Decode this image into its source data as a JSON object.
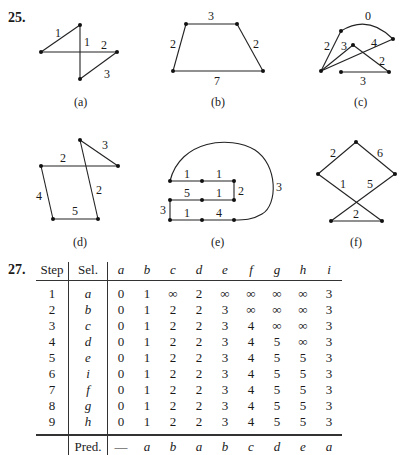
{
  "problem25": {
    "number": "25.",
    "graphs": [
      {
        "id": "a",
        "caption": "(a)",
        "edge_labels": [
          "1",
          "1",
          "2",
          "3"
        ]
      },
      {
        "id": "b",
        "caption": "(b)",
        "edge_labels": [
          "3",
          "2",
          "2",
          "7"
        ]
      },
      {
        "id": "c",
        "caption": "(c)",
        "edge_labels": [
          "0",
          "2",
          "3",
          "4",
          "2",
          "3"
        ]
      },
      {
        "id": "d",
        "caption": "(d)",
        "edge_labels": [
          "3",
          "2",
          "4",
          "5",
          "2"
        ]
      },
      {
        "id": "e",
        "caption": "(e)",
        "edge_labels": [
          "1",
          "1",
          "5",
          "1",
          "2",
          "3",
          "1",
          "4",
          "3"
        ]
      },
      {
        "id": "f",
        "caption": "(f)",
        "edge_labels": [
          "2",
          "6",
          "1",
          "5",
          "2"
        ]
      }
    ]
  },
  "problem27": {
    "number": "27.",
    "headers": [
      "Step",
      "Sel.",
      "a",
      "b",
      "c",
      "d",
      "e",
      "f",
      "g",
      "h",
      "i"
    ],
    "rows": [
      {
        "step": "1",
        "sel": "a",
        "values": [
          "0",
          "1",
          "∞",
          "2",
          "∞",
          "∞",
          "∞",
          "∞",
          "3"
        ]
      },
      {
        "step": "2",
        "sel": "b",
        "values": [
          "0",
          "1",
          "2",
          "2",
          "3",
          "∞",
          "∞",
          "∞",
          "3"
        ]
      },
      {
        "step": "3",
        "sel": "c",
        "values": [
          "0",
          "1",
          "2",
          "2",
          "3",
          "4",
          "∞",
          "∞",
          "3"
        ]
      },
      {
        "step": "4",
        "sel": "d",
        "values": [
          "0",
          "1",
          "2",
          "2",
          "3",
          "4",
          "5",
          "∞",
          "3"
        ]
      },
      {
        "step": "5",
        "sel": "e",
        "values": [
          "0",
          "1",
          "2",
          "2",
          "3",
          "4",
          "5",
          "5",
          "3"
        ]
      },
      {
        "step": "6",
        "sel": "i",
        "values": [
          "0",
          "1",
          "2",
          "2",
          "3",
          "4",
          "5",
          "5",
          "3"
        ]
      },
      {
        "step": "7",
        "sel": "f",
        "values": [
          "0",
          "1",
          "2",
          "2",
          "3",
          "4",
          "5",
          "5",
          "3"
        ]
      },
      {
        "step": "8",
        "sel": "g",
        "values": [
          "0",
          "1",
          "2",
          "2",
          "3",
          "4",
          "5",
          "5",
          "3"
        ]
      },
      {
        "step": "9",
        "sel": "h",
        "values": [
          "0",
          "1",
          "2",
          "2",
          "3",
          "4",
          "5",
          "5",
          "3"
        ]
      }
    ],
    "pred": {
      "label": "Pred.",
      "values": [
        "—",
        "a",
        "b",
        "a",
        "b",
        "c",
        "d",
        "e",
        "a"
      ]
    }
  }
}
